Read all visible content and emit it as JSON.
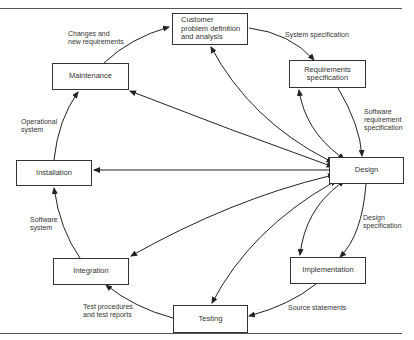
{
  "diagram": {
    "type": "software-lifecycle-cycle",
    "nodes": {
      "customer": "Customer\nproblem definition\nand analysis",
      "requirements": "Requirements\nspecification",
      "design": "Design",
      "implementation": "Implementation",
      "testing": "Testing",
      "integration": "Integration",
      "installation": "Installation",
      "maintenance": "Maintenance"
    },
    "edge_labels": {
      "customer_to_requirements": "System specification",
      "requirements_to_design": "Software\nrequirement\nspecification",
      "design_to_implementation": "Design\nspecification",
      "implementation_to_testing": "Source statements",
      "testing_to_integration": "Test procedures\nand test reports",
      "integration_to_installation": "Software\nsystem",
      "installation_to_maintenance": "Operational\nsystem",
      "maintenance_to_customer": "Changes and\nnew requirements"
    },
    "colors": {
      "line": "#222222",
      "box_border": "#333333",
      "text": "#333333"
    }
  }
}
